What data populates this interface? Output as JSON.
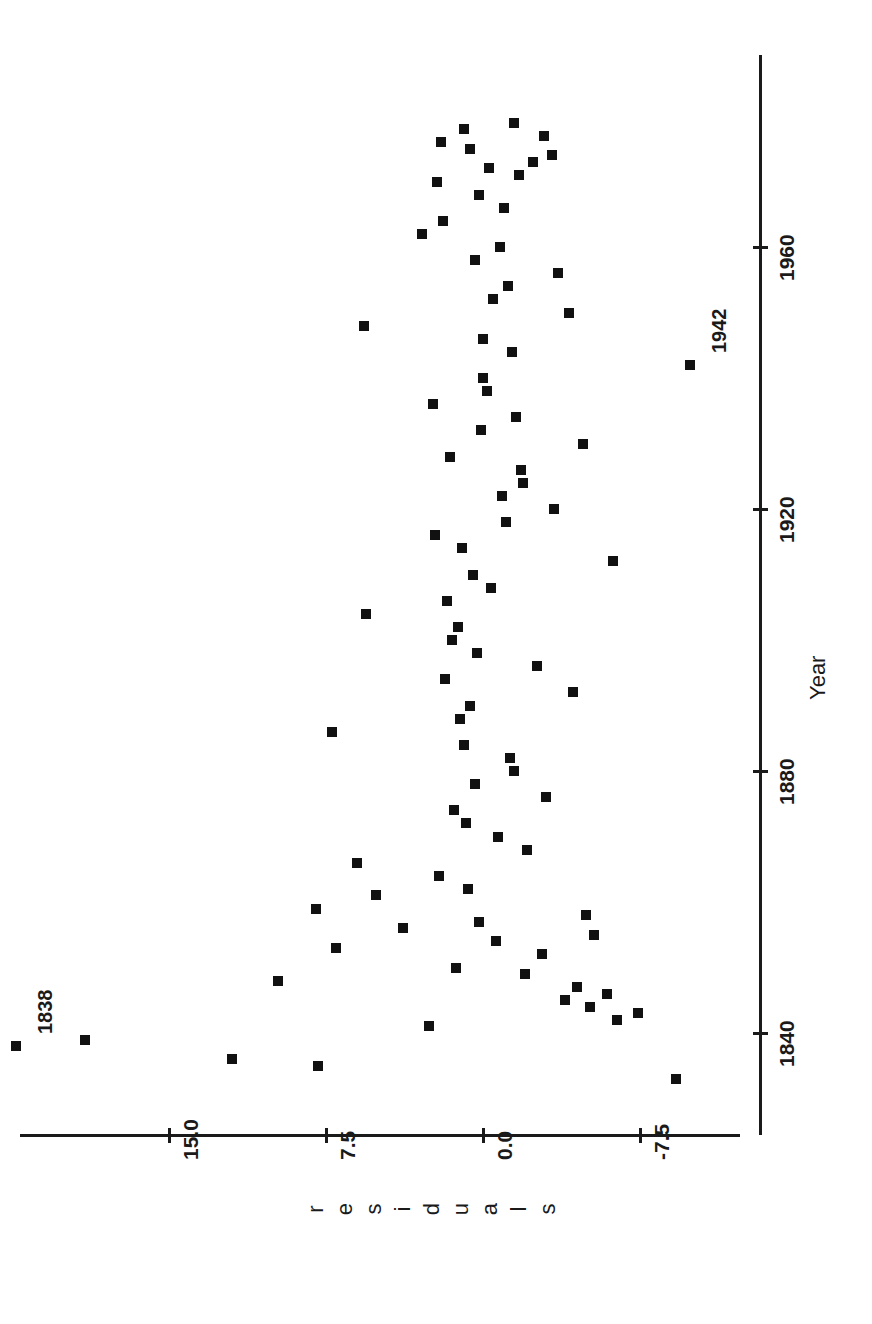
{
  "figure": {
    "orientation": "rotated-90-ccw",
    "background": "#ffffff",
    "marker_color": "#111111"
  },
  "chart_data": {
    "type": "scatter",
    "title": "",
    "xlabel": "Year",
    "ylabel": "residuals",
    "xlim": [
      1832,
      1980
    ],
    "ylim": [
      -11.0,
      23.5
    ],
    "xticks": [
      1840,
      1880,
      1920,
      1960
    ],
    "xtick_labels": [
      "1840",
      "1880",
      "1920",
      "1960"
    ],
    "yticks": [
      15.0,
      7.5,
      0.0,
      -7.5
    ],
    "ytick_labels": [
      "15.0",
      "7.5",
      "0.0",
      "-7.5"
    ],
    "grid": false,
    "legend": null,
    "annotations": [
      {
        "label": "1838",
        "year": 1838,
        "residual": 22.3
      },
      {
        "label": "1942",
        "year": 1942,
        "residual": -9.9
      }
    ],
    "points": [
      {
        "year": 1833,
        "residual": -9.2
      },
      {
        "year": 1835,
        "residual": 7.9
      },
      {
        "year": 1836,
        "residual": 12.0
      },
      {
        "year": 1838,
        "residual": 22.3
      },
      {
        "year": 1839,
        "residual": 19.0
      },
      {
        "year": 1841,
        "residual": 2.6
      },
      {
        "year": 1842,
        "residual": -6.4
      },
      {
        "year": 1843,
        "residual": -7.4
      },
      {
        "year": 1844,
        "residual": -5.1
      },
      {
        "year": 1845,
        "residual": -3.9
      },
      {
        "year": 1846,
        "residual": -5.9
      },
      {
        "year": 1847,
        "residual": -4.5
      },
      {
        "year": 1848,
        "residual": 9.8
      },
      {
        "year": 1849,
        "residual": -2.0
      },
      {
        "year": 1850,
        "residual": 1.3
      },
      {
        "year": 1852,
        "residual": -2.8
      },
      {
        "year": 1853,
        "residual": 7.0
      },
      {
        "year": 1854,
        "residual": -0.6
      },
      {
        "year": 1855,
        "residual": -5.3
      },
      {
        "year": 1856,
        "residual": 3.8
      },
      {
        "year": 1857,
        "residual": 0.2
      },
      {
        "year": 1858,
        "residual": -4.9
      },
      {
        "year": 1859,
        "residual": 8.0
      },
      {
        "year": 1861,
        "residual": 5.1
      },
      {
        "year": 1862,
        "residual": 0.7
      },
      {
        "year": 1864,
        "residual": 2.1
      },
      {
        "year": 1866,
        "residual": 6.0
      },
      {
        "year": 1868,
        "residual": -2.1
      },
      {
        "year": 1870,
        "residual": -0.7
      },
      {
        "year": 1872,
        "residual": 0.8
      },
      {
        "year": 1874,
        "residual": 1.4
      },
      {
        "year": 1876,
        "residual": -3.0
      },
      {
        "year": 1878,
        "residual": 0.4
      },
      {
        "year": 1880,
        "residual": -1.5
      },
      {
        "year": 1882,
        "residual": -1.3
      },
      {
        "year": 1884,
        "residual": 0.9
      },
      {
        "year": 1886,
        "residual": 7.2
      },
      {
        "year": 1888,
        "residual": 1.1
      },
      {
        "year": 1890,
        "residual": 0.6
      },
      {
        "year": 1892,
        "residual": -4.3
      },
      {
        "year": 1894,
        "residual": 1.8
      },
      {
        "year": 1896,
        "residual": -2.6
      },
      {
        "year": 1898,
        "residual": 0.3
      },
      {
        "year": 1900,
        "residual": 1.5
      },
      {
        "year": 1902,
        "residual": 1.2
      },
      {
        "year": 1904,
        "residual": 5.6
      },
      {
        "year": 1906,
        "residual": 1.7
      },
      {
        "year": 1908,
        "residual": -0.4
      },
      {
        "year": 1910,
        "residual": 0.5
      },
      {
        "year": 1912,
        "residual": -6.2
      },
      {
        "year": 1914,
        "residual": 1.0
      },
      {
        "year": 1916,
        "residual": 2.3
      },
      {
        "year": 1918,
        "residual": -1.1
      },
      {
        "year": 1920,
        "residual": -3.4
      },
      {
        "year": 1922,
        "residual": -0.9
      },
      {
        "year": 1924,
        "residual": -1.9
      },
      {
        "year": 1926,
        "residual": -1.8
      },
      {
        "year": 1928,
        "residual": 1.6
      },
      {
        "year": 1930,
        "residual": -4.8
      },
      {
        "year": 1932,
        "residual": 0.1
      },
      {
        "year": 1934,
        "residual": -1.6
      },
      {
        "year": 1936,
        "residual": 2.4
      },
      {
        "year": 1938,
        "residual": -0.2
      },
      {
        "year": 1940,
        "residual": 0.0
      },
      {
        "year": 1942,
        "residual": -9.9
      },
      {
        "year": 1944,
        "residual": -1.4
      },
      {
        "year": 1946,
        "residual": 0.0
      },
      {
        "year": 1948,
        "residual": 5.7
      },
      {
        "year": 1950,
        "residual": -4.1
      },
      {
        "year": 1952,
        "residual": -0.5
      },
      {
        "year": 1954,
        "residual": -1.2
      },
      {
        "year": 1956,
        "residual": -3.6
      },
      {
        "year": 1958,
        "residual": 0.4
      },
      {
        "year": 1960,
        "residual": -0.8
      },
      {
        "year": 1962,
        "residual": 2.9
      },
      {
        "year": 1964,
        "residual": 1.9
      },
      {
        "year": 1966,
        "residual": -1.0
      },
      {
        "year": 1968,
        "residual": 0.2
      },
      {
        "year": 1970,
        "residual": 2.2
      },
      {
        "year": 1971,
        "residual": -1.7
      },
      {
        "year": 1972,
        "residual": -0.3
      },
      {
        "year": 1973,
        "residual": -2.4
      },
      {
        "year": 1974,
        "residual": -3.3
      },
      {
        "year": 1975,
        "residual": 0.6
      },
      {
        "year": 1976,
        "residual": 2.0
      },
      {
        "year": 1977,
        "residual": -2.9
      },
      {
        "year": 1978,
        "residual": 0.9
      },
      {
        "year": 1979,
        "residual": -1.5
      }
    ]
  },
  "axes": {
    "year_axis": {
      "title": "Year",
      "ticks": [
        {
          "label": "1840"
        },
        {
          "label": "1880"
        },
        {
          "label": "1920"
        },
        {
          "label": "1960"
        }
      ]
    },
    "residuals_axis": {
      "title": "residuals",
      "title_letters": [
        "r",
        "e",
        "s",
        "i",
        "d",
        "u",
        "a",
        "l",
        "s"
      ],
      "ticks": [
        {
          "label": "15.0"
        },
        {
          "label": "7.5"
        },
        {
          "label": "0.0"
        },
        {
          "label": "-7.5"
        }
      ]
    }
  }
}
